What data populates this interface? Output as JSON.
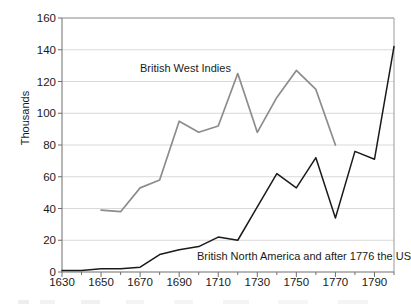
{
  "chart_data": {
    "type": "line",
    "title": "",
    "xlabel": "",
    "ylabel": "Thousands",
    "xlim": [
      1630,
      1800
    ],
    "ylim": [
      0,
      160
    ],
    "yticks": [
      0,
      20,
      40,
      60,
      80,
      100,
      120,
      140,
      160
    ],
    "xticks": [
      1630,
      1650,
      1670,
      1690,
      1710,
      1730,
      1750,
      1770,
      1790
    ],
    "xtick_labels": [
      "1630",
      "1650",
      "1670",
      "1690",
      "1710",
      "1730",
      "1750",
      "1770",
      "1790"
    ],
    "ytick_labels": [
      "0",
      "20",
      "40",
      "60",
      "80",
      "100",
      "120",
      "140",
      "160"
    ],
    "minor_xtick_step": 10,
    "grid": "horizontal",
    "legend": "inline-labels",
    "series": [
      {
        "name": "British West Indies",
        "color": "#8c8c8c",
        "label_position": "above-line",
        "x": [
          1650,
          1660,
          1670,
          1680,
          1690,
          1700,
          1710,
          1720,
          1730,
          1740,
          1750,
          1760,
          1770
        ],
        "values": [
          39,
          38,
          53,
          58,
          95,
          88,
          92,
          125,
          88,
          110,
          127,
          115,
          80
        ]
      },
      {
        "name": "British North America and after 1776 the US",
        "color": "#1a1a1a",
        "label_position": "below-line",
        "x": [
          1630,
          1640,
          1650,
          1660,
          1670,
          1680,
          1690,
          1700,
          1710,
          1720,
          1730,
          1740,
          1750,
          1760,
          1770,
          1780,
          1790,
          1800
        ],
        "values": [
          1,
          1,
          2,
          2,
          3,
          11,
          14,
          16,
          22,
          20,
          41,
          62,
          53,
          72,
          34,
          76,
          71,
          142
        ]
      }
    ],
    "annotations": [
      {
        "text": "British West Indies",
        "series": "British West Indies"
      },
      {
        "text": "British North America and after 1776 the US",
        "series": "British North America and after 1776 the US"
      }
    ]
  },
  "colors": {
    "west_indies": "#8c8c8c",
    "north_america": "#1a1a1a",
    "grid": "#d9d9d9",
    "frame": "#808080",
    "text": "#1a1a1a",
    "background": "#ffffff"
  }
}
